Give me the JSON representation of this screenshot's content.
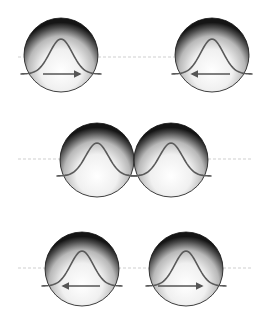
{
  "diagram": {
    "title": "",
    "colors": {
      "background": "#ffffff",
      "curve": "#5a5a5a",
      "arrow": "#555555",
      "dashed_line": "#cfcfcf",
      "sphere_center": "#ffffff",
      "sphere_mid": "#d8d8d8",
      "sphere_edge": "#3a3a3a",
      "sphere_rim": "#111111"
    },
    "radius": 37,
    "rows": [
      {
        "name": "approaching",
        "axis_y": 57,
        "axis_x1": 18,
        "axis_x2": 250,
        "spheres": [
          {
            "cx": 61,
            "cy": 55,
            "baseline_y": 74,
            "peak_y": 39,
            "arrow": {
              "direction": "right",
              "x1": 43,
              "x2": 80,
              "y": 74
            }
          },
          {
            "cx": 212,
            "cy": 55,
            "baseline_y": 74,
            "peak_y": 39,
            "arrow": {
              "direction": "left",
              "x1": 192,
              "x2": 230,
              "y": 74
            }
          }
        ]
      },
      {
        "name": "collision",
        "axis_y": 159,
        "axis_x1": 18,
        "axis_x2": 252,
        "spheres": [
          {
            "cx": 97,
            "cy": 160,
            "baseline_y": 176,
            "peak_y": 143,
            "arrow": null
          },
          {
            "cx": 171,
            "cy": 160,
            "baseline_y": 176,
            "peak_y": 143,
            "arrow": null
          }
        ]
      },
      {
        "name": "receding",
        "axis_y": 268,
        "axis_x1": 18,
        "axis_x2": 252,
        "spheres": [
          {
            "cx": 82,
            "cy": 269,
            "baseline_y": 286,
            "peak_y": 251,
            "arrow": {
              "direction": "left",
              "x1": 63,
              "x2": 100,
              "y": 286
            }
          },
          {
            "cx": 186,
            "cy": 269,
            "baseline_y": 286,
            "peak_y": 251,
            "arrow": {
              "direction": "right",
              "x1": 158,
              "x2": 202,
              "y": 286
            }
          }
        ]
      }
    ]
  }
}
